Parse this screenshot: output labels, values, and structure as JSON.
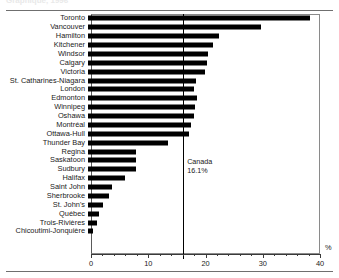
{
  "title_partial": "Graphique, 1996",
  "axis": {
    "unit": "%",
    "ticks": [
      0,
      10,
      20,
      30,
      40
    ],
    "minor_step": 2,
    "xmin": 0,
    "xmax": 40
  },
  "reference": {
    "name": "Canada",
    "value_label": "16.1%",
    "value": 16.1
  },
  "chart_data": {
    "type": "bar",
    "orientation": "horizontal",
    "title": "",
    "xlabel": "%",
    "ylabel": "",
    "xlim": [
      0,
      40
    ],
    "grid": false,
    "legend": false,
    "annotations": [
      {
        "text": "Canada",
        "value": 16.1
      },
      {
        "text": "16.1%",
        "value": 16.1
      }
    ],
    "categories": [
      "Toronto",
      "Vancouver",
      "Hamilton",
      "Kitchener",
      "Windsor",
      "Calgary",
      "Victoria",
      "St. Catharines-Niagara",
      "London",
      "Edmonton",
      "Winnipeg",
      "Oshawa",
      "Montréal",
      "Ottawa-Hull",
      "Thunder Bay",
      "Regina",
      "Saskatoon",
      "Sudbury",
      "Halifax",
      "Saint John",
      "Sherbrooke",
      "St. John's",
      "Québec",
      "Trois-Rivières",
      "Chicoutimi-Jonquière"
    ],
    "values": [
      38.8,
      30.2,
      22.9,
      21.8,
      20.9,
      20.7,
      20.4,
      18.8,
      18.6,
      19.0,
      18.7,
      18.5,
      18.0,
      17.6,
      14.0,
      8.4,
      8.3,
      8.3,
      6.5,
      4.2,
      3.7,
      2.7,
      1.9,
      1.5,
      0.8
    ]
  }
}
